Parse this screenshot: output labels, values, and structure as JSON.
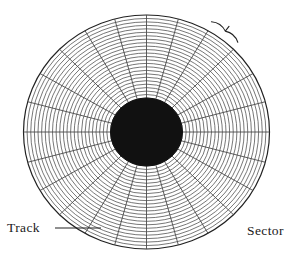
{
  "figure": {
    "title": "",
    "width": 288,
    "height": 260,
    "background": "#ffffff"
  },
  "labels": {
    "track": "Track",
    "sector": "Sector"
  },
  "diagram": {
    "type": "disk-platter",
    "center": {
      "x": 146.5,
      "y": 132
    },
    "outer_radius_x": 123,
    "outer_radius_y": 117,
    "hub_radius_x": 36,
    "hub_radius_y": 34,
    "hub_color": "#111111",
    "line_color": "#4a4a4a",
    "outline_color": "#222222",
    "track_count": 24,
    "sector_count": 24,
    "sector_angle_degrees": 15,
    "leader_line": {
      "x1": 55,
      "y1": 228,
      "x2": 101,
      "y2": 228
    },
    "brace": {
      "center_angle_degrees": 308,
      "span_degrees": 15,
      "radius": 128
    }
  },
  "chart_data": {
    "type": "pie",
    "categories": [
      "S1",
      "S2",
      "S3",
      "S4",
      "S5",
      "S6",
      "S7",
      "S8",
      "S9",
      "S10",
      "S11",
      "S12",
      "S13",
      "S14",
      "S15",
      "S16",
      "S17",
      "S18",
      "S19",
      "S20",
      "S21",
      "S22",
      "S23",
      "S24"
    ],
    "values": [
      15,
      15,
      15,
      15,
      15,
      15,
      15,
      15,
      15,
      15,
      15,
      15,
      15,
      15,
      15,
      15,
      15,
      15,
      15,
      15,
      15,
      15,
      15,
      15
    ],
    "rings": 24,
    "xlabel": "",
    "ylabel": "",
    "legend": [
      "Track",
      "Sector"
    ],
    "annotations": [
      "Track",
      "Sector"
    ]
  }
}
